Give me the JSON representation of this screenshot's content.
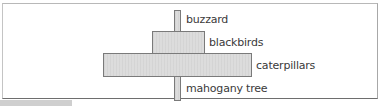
{
  "diagram": {
    "type": "pyramid-of-numbers",
    "levels": [
      {
        "label": "buzzard",
        "relative_width": 6
      },
      {
        "label": "blackbirds",
        "relative_width": 52
      },
      {
        "label": "caterpillars",
        "relative_width": 148
      },
      {
        "label": "mahogany tree",
        "relative_width": 6
      }
    ]
  },
  "colors": {
    "bar_fill": "#dcdcdc",
    "bar_border": "#7a7a7a",
    "frame_border": "#b8b8b8",
    "label_text": "#3a3a3a"
  }
}
